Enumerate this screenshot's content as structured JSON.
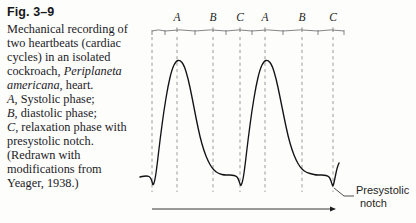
{
  "figure": {
    "number": "Fig. 3–9",
    "caption_lines": [
      [
        {
          "t": "Mechanical recording of",
          "i": false
        }
      ],
      [
        {
          "t": "two heartbeats (cardiac",
          "i": false
        }
      ],
      [
        {
          "t": "cycles) in an isolated",
          "i": false
        }
      ],
      [
        {
          "t": "cockroach, ",
          "i": false
        },
        {
          "t": "Periplaneta",
          "i": true
        }
      ],
      [
        {
          "t": "americana",
          "i": true
        },
        {
          "t": ", heart.",
          "i": false
        }
      ],
      [
        {
          "t": "A",
          "i": true
        },
        {
          "t": ", Systolic phase;",
          "i": false
        }
      ],
      [
        {
          "t": "B",
          "i": true
        },
        {
          "t": ", diastolic phase;",
          "i": false
        }
      ],
      [
        {
          "t": "C",
          "i": true
        },
        {
          "t": ", relaxation phase with",
          "i": false
        }
      ],
      [
        {
          "t": "presystolic notch.",
          "i": false
        }
      ],
      [
        {
          "t": "(Redrawn with",
          "i": false
        }
      ],
      [
        {
          "t": "modifications from",
          "i": false
        }
      ],
      [
        {
          "t": "Yeager, 1938.)",
          "i": false
        }
      ]
    ],
    "annotation": {
      "notch_line1": "Presystolic",
      "notch_line2": "notch"
    },
    "colors": {
      "trace": "#131317",
      "gridline": "#9a9a9a",
      "bracket": "#6f6f72",
      "text": "#1b1b1f",
      "background": "#fdfdfc"
    }
  },
  "chart_data": {
    "type": "line",
    "xlabel": "Time",
    "ylabel": "Mechanical displacement",
    "xlim": [
      140,
      345
    ],
    "ylim": [
      190,
      55
    ],
    "grid": true,
    "legend_position": "none",
    "axis_ticks_visible": false,
    "phase_labels": [
      "A",
      "B",
      "C",
      "A",
      "B",
      "C"
    ],
    "phase_label_x": [
      177,
      213,
      240,
      265,
      302,
      333
    ],
    "phase_label_y": 16,
    "phase_descriptions": {
      "A": "Systolic phase",
      "B": "Diastolic phase",
      "C": "Relaxation phase with presystolic notch"
    },
    "gridline_x": [
      152,
      177,
      213,
      240,
      265,
      302,
      333
    ],
    "bracket": {
      "y": 31,
      "x_start": 152,
      "x_end": 344,
      "tick_height": 4,
      "segment_edges": [
        152,
        165,
        195,
        226,
        252,
        283,
        318,
        344
      ]
    },
    "time_arrow": {
      "x_start": 152,
      "x_end": 336,
      "y": 209
    },
    "baseline_y": 178,
    "peak_y": 60,
    "notch_depth_y": 186,
    "annotation_leader": {
      "x1": 334,
      "y1": 188,
      "x2": 344,
      "y2": 196,
      "x3": 354,
      "y3": 196
    },
    "annotation_text_x": 356,
    "annotation_text_y": 194,
    "series": [
      {
        "name": "heart contraction trace",
        "points": [
          [
            140,
            177
          ],
          [
            144,
            176
          ],
          [
            148,
            176
          ],
          [
            150,
            177
          ],
          [
            152,
            181
          ],
          [
            153,
            186
          ],
          [
            155,
            180
          ],
          [
            157,
            166
          ],
          [
            160,
            140
          ],
          [
            164,
            110
          ],
          [
            168,
            86
          ],
          [
            172,
            69
          ],
          [
            176,
            61
          ],
          [
            180,
            60
          ],
          [
            184,
            65
          ],
          [
            188,
            78
          ],
          [
            192,
            97
          ],
          [
            196,
            118
          ],
          [
            200,
            137
          ],
          [
            204,
            151
          ],
          [
            208,
            161
          ],
          [
            212,
            168
          ],
          [
            216,
            172
          ],
          [
            220,
            174
          ],
          [
            224,
            175
          ],
          [
            228,
            175
          ],
          [
            232,
            175
          ],
          [
            236,
            176
          ],
          [
            238,
            178
          ],
          [
            240,
            184
          ],
          [
            241,
            186
          ],
          [
            243,
            180
          ],
          [
            245,
            166
          ],
          [
            248,
            140
          ],
          [
            252,
            110
          ],
          [
            256,
            86
          ],
          [
            260,
            69
          ],
          [
            264,
            61
          ],
          [
            268,
            60
          ],
          [
            272,
            65
          ],
          [
            276,
            78
          ],
          [
            280,
            97
          ],
          [
            284,
            117
          ],
          [
            288,
            136
          ],
          [
            292,
            150
          ],
          [
            296,
            160
          ],
          [
            300,
            167
          ],
          [
            304,
            171
          ],
          [
            308,
            173
          ],
          [
            312,
            174
          ],
          [
            316,
            175
          ],
          [
            320,
            175
          ],
          [
            324,
            175
          ],
          [
            328,
            176
          ],
          [
            330,
            178
          ],
          [
            332,
            184
          ],
          [
            333,
            187
          ],
          [
            335,
            178
          ],
          [
            337,
            168
          ],
          [
            339,
            163
          ]
        ]
      }
    ]
  }
}
